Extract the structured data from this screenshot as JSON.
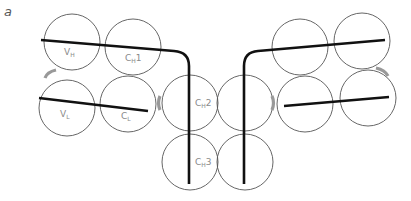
{
  "panel_label": "a",
  "domains": [
    {
      "id": "VH",
      "label": "V",
      "sub": "H",
      "suffix": "",
      "cx": 72,
      "cy": 42,
      "r": 28
    },
    {
      "id": "CH1",
      "label": "C",
      "sub": "H",
      "suffix": "1",
      "cx": 133,
      "cy": 47,
      "r": 28
    },
    {
      "id": "VL",
      "label": "V",
      "sub": "L",
      "suffix": "",
      "cx": 67,
      "cy": 108,
      "r": 28
    },
    {
      "id": "CL",
      "label": "C",
      "sub": "L",
      "suffix": "",
      "cx": 128,
      "cy": 104,
      "r": 28
    },
    {
      "id": "CH2",
      "label": "C",
      "sub": "H",
      "suffix": "2",
      "cx": 190,
      "cy": 103,
      "r": 28
    },
    {
      "id": "CH3",
      "label": "C",
      "sub": "H",
      "suffix": "3",
      "cx": 190,
      "cy": 162,
      "r": 28
    },
    {
      "id": "CH2b",
      "label": "",
      "sub": "",
      "suffix": "",
      "cx": 245,
      "cy": 103,
      "r": 28
    },
    {
      "id": "CH3b",
      "label": "",
      "sub": "",
      "suffix": "",
      "cx": 245,
      "cy": 162,
      "r": 28
    },
    {
      "id": "CH1b",
      "label": "",
      "sub": "",
      "suffix": "",
      "cx": 300,
      "cy": 47,
      "r": 28
    },
    {
      "id": "VHb",
      "label": "",
      "sub": "",
      "suffix": "",
      "cx": 362,
      "cy": 41,
      "r": 28
    },
    {
      "id": "CLb",
      "label": "",
      "sub": "",
      "suffix": "",
      "cx": 305,
      "cy": 104,
      "r": 28
    },
    {
      "id": "VLb",
      "label": "",
      "sub": "",
      "suffix": "",
      "cx": 368,
      "cy": 98,
      "r": 28
    }
  ],
  "labels": {
    "VH": {
      "main": "V",
      "sub": "H",
      "suffix": ""
    },
    "CH1": {
      "main": "C",
      "sub": "H",
      "suffix": "1"
    },
    "VL": {
      "main": "V",
      "sub": "L",
      "suffix": ""
    },
    "CL": {
      "main": "C",
      "sub": "L",
      "suffix": ""
    },
    "CH2": {
      "main": "C",
      "sub": "H",
      "suffix": "2"
    },
    "CH3": {
      "main": "C",
      "sub": "H",
      "suffix": "3"
    }
  },
  "colors": {
    "domain_outline": "#555555",
    "chain_line": "#111111",
    "disulfide_arc": "#999999",
    "label_text": "#8a8a8a"
  }
}
